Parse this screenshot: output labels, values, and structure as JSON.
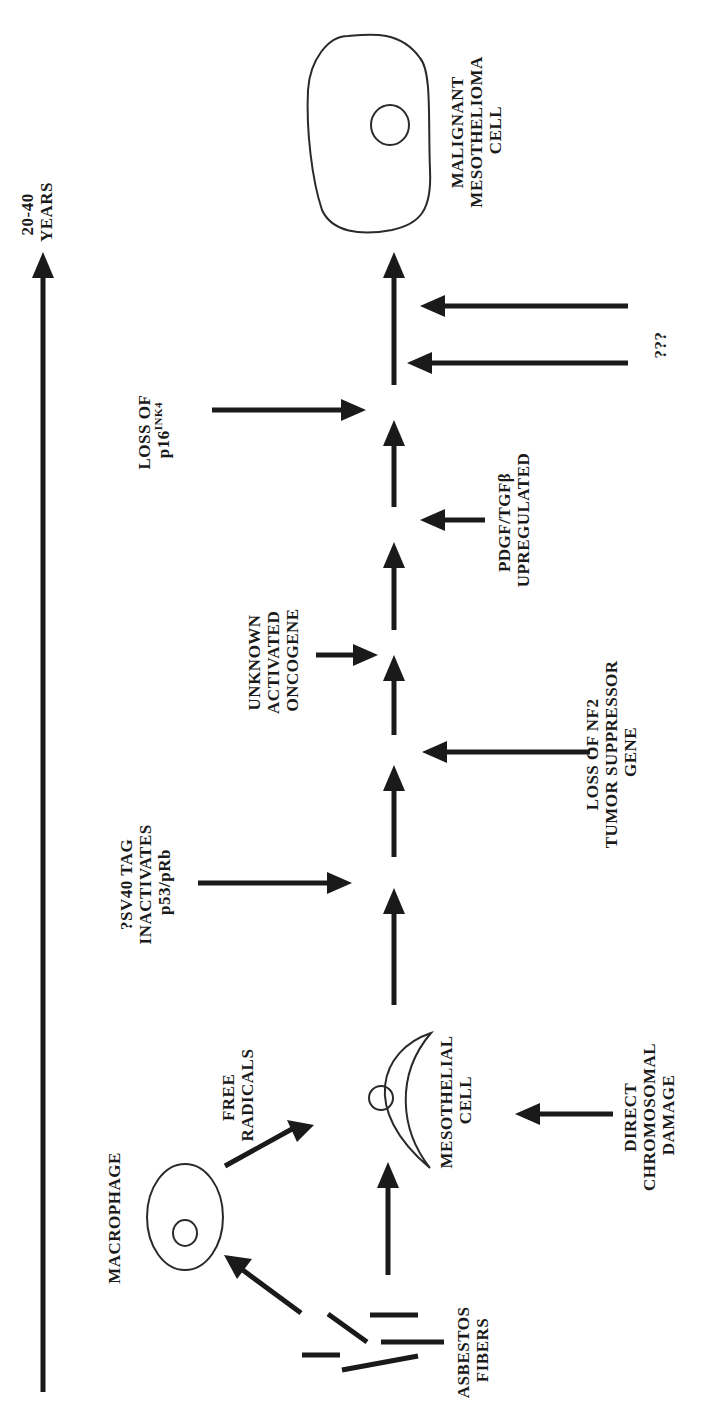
{
  "diagram": {
    "orientation": "rotated 90 degrees counter-clockwise",
    "colors": {
      "ink": "#1a1a1a",
      "background": "#ffffff"
    },
    "timeline": {
      "label_line1": "20-40",
      "label_line2": "YEARS"
    },
    "nodes": {
      "asbestos": {
        "line1": "ASBESTOS",
        "line2": "FIBERS"
      },
      "macrophage": {
        "line1": "MACROPHAGE"
      },
      "free_radicals": {
        "line1": "FREE",
        "line2": "RADICALS"
      },
      "mesothelial": {
        "line1": "MESOTHELIAL",
        "line2": "CELL"
      },
      "direct_damage": {
        "line1": "DIRECT",
        "line2": "CHROMOSOMAL",
        "line3": "DAMAGE"
      },
      "sv40": {
        "line1": "?SV40 TAG",
        "line2": "INACTIVATES",
        "line3": "p53/pRb"
      },
      "nf2": {
        "line1": "LOSS OF NF2",
        "line2": "TUMOR SUPPRESSOR",
        "line3": "GENE"
      },
      "oncogene": {
        "line1": "UNKNOWN",
        "line2": "ACTIVATED",
        "line3": "ONCOGENE"
      },
      "pdgf": {
        "line1": "PDGF/TGFβ",
        "line2": "UPREGULATED"
      },
      "p16": {
        "line1": "LOSS OF",
        "line2_base": "p16",
        "line2_sup": "INK4"
      },
      "unknown": {
        "line1": "???"
      },
      "malignant": {
        "line1": "MALIGNANT",
        "line2": "MESOTHELIOMA",
        "line3": "CELL"
      }
    }
  }
}
